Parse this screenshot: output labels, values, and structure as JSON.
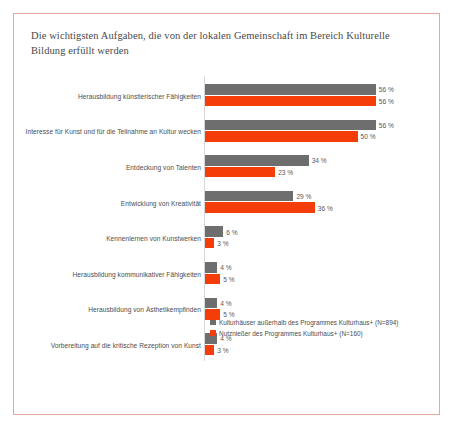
{
  "card": {
    "border_color": "#e3a89f",
    "background": "#ffffff"
  },
  "chart_data": {
    "type": "bar",
    "orientation": "horizontal",
    "title": "Die wichtigsten Aufgaben, die von der lokalen Gemeinschaft im Bereich Kulturelle Bildung erfüllt werden",
    "xlabel": "",
    "ylabel": "",
    "xlim": [
      0,
      60
    ],
    "grid": false,
    "legend_position": "bottom-right",
    "value_suffix": " %",
    "categories": [
      "Herausbildung künstlerischer Fähigkeiten",
      "Interesse für Kunst und für die Teilnahme an Kultur wecken",
      "Entdeckung von Talenten",
      "Entwicklung von Kreativität",
      "Kennenlernen von Kunstwerken",
      "Herausbildung kommunikativer Fähigkeiten",
      "Herausbildung von Ästhetikempfinden",
      "Vorbereitung auf die kritische Rezeption von Kunst"
    ],
    "series": [
      {
        "name": "Kulturhäuser außerhalb des Programmes Kulturhaus+ (N=894)",
        "color": "#6e6e6e",
        "values": [
          56,
          56,
          34,
          29,
          6,
          4,
          4,
          4
        ],
        "labels": [
          "56 %",
          "56 %",
          "34 %",
          "29 %",
          "6 %",
          "4 %",
          "4 %",
          "4 %"
        ]
      },
      {
        "name": "Nutznießer des Programmes Kulturhaus+ (N=160)",
        "color": "#f53d0a",
        "values": [
          56,
          50,
          23,
          36,
          3,
          5,
          5,
          3
        ],
        "labels": [
          "56 %",
          "50 %",
          "23 %",
          "36 %",
          "3 %",
          "5 %",
          "5 %",
          "3 %"
        ]
      }
    ]
  }
}
